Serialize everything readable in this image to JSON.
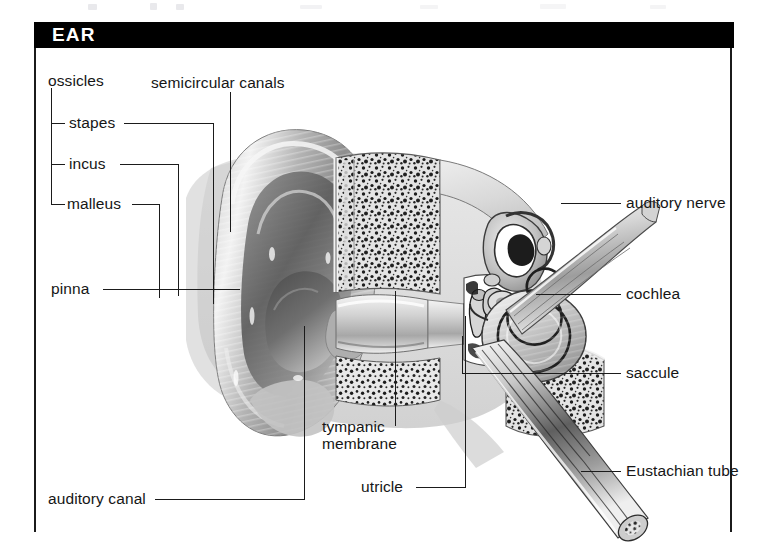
{
  "figure": {
    "title": "EAR",
    "domain_subject": "ear anatomy cross-section",
    "labels": {
      "ossicles": "ossicles",
      "stapes": "stapes",
      "incus": "incus",
      "malleus": "malleus",
      "semicircular_canals": "semicircular canals",
      "auditory_nerve": "auditory nerve",
      "cochlea": "cochlea",
      "saccule": "saccule",
      "eustachian_tube": "Eustachian tube",
      "pinna": "pinna",
      "tympanic_membrane_line1": "tympanic",
      "tympanic_membrane_line2": "membrane",
      "utricle": "utricle",
      "auditory_canal": "auditory canal"
    },
    "colors": {
      "title_bar": "#000000",
      "title_text": "#ffffff",
      "label_text": "#161616",
      "leader_line": "#1b1b1b",
      "background": "#ffffff",
      "artwork_mid_gray": "#9a9a9a",
      "artwork_dark": "#2e2e2e",
      "artwork_light": "#e2e2e2"
    }
  }
}
